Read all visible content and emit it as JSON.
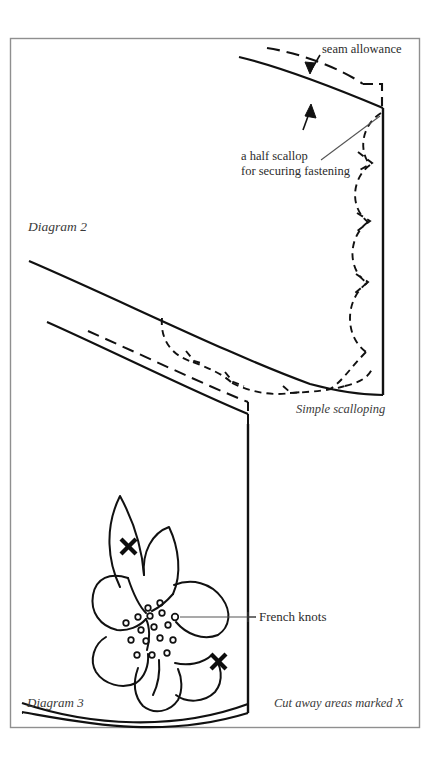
{
  "page": {
    "background_color": "#ffffff",
    "ink_color": "#1a1a1a",
    "frame_color": "#8a8a8a",
    "width": 441,
    "height": 774
  },
  "frame": {
    "x": 10,
    "y": 38,
    "width": 410,
    "height": 690
  },
  "diagram2": {
    "caption": "Diagram 2",
    "caption_position": {
      "x": 28,
      "y": 231
    },
    "sub_caption": "Simple scalloping",
    "sub_caption_position": {
      "x": 296,
      "y": 413
    },
    "annotations": [
      {
        "name": "seam-allowance",
        "text": "seam allowance",
        "x": 322,
        "y": 53,
        "anchor": "start"
      },
      {
        "name": "half-scallop",
        "text_line1": "a half scallop",
        "text_line2": "for securing fastening",
        "x": 241,
        "y": 160,
        "anchor": "start"
      }
    ],
    "scallop_count_right_edge": 4,
    "scallop_count_bottom_curve": 4,
    "half_scallop_count": 1
  },
  "diagram3": {
    "caption": "Diagram 3",
    "caption_position": {
      "x": 27,
      "y": 707
    },
    "sub_caption": "Cut away areas marked X",
    "sub_caption_position": {
      "x": 274,
      "y": 707
    },
    "annotations": [
      {
        "name": "french-knots",
        "text": "French knots",
        "x": 259,
        "y": 620,
        "anchor": "start"
      }
    ],
    "cut_marks": [
      {
        "name": "x-mark-upper-petal",
        "x": 128,
        "y": 546,
        "size": 13
      },
      {
        "name": "x-mark-lower-right",
        "x": 218,
        "y": 661,
        "size": 13
      }
    ],
    "french_knot_count": 17,
    "petal_count": 6
  }
}
